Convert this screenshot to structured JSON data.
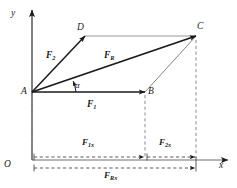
{
  "figure": {
    "background_color": "#ffffff",
    "stroke_color": "#1a1a1a",
    "dashed_color": "#8c8c8c",
    "thin_color": "#555555"
  },
  "axes": {
    "x_label": "x",
    "y_label": "y",
    "origin_label": "O"
  },
  "points": {
    "A": "A",
    "B": "B",
    "C": "C",
    "D": "D"
  },
  "vectors": {
    "f1": {
      "base": "F",
      "sub": "1"
    },
    "f2": {
      "base": "F",
      "sub": "2"
    },
    "fr": {
      "base": "F",
      "sub": "R"
    }
  },
  "dimensions": {
    "f1x": {
      "base": "F",
      "sub": "1x"
    },
    "f2x": {
      "base": "F",
      "sub": "2x"
    },
    "frx": {
      "base": "F",
      "sub": "Rx"
    }
  },
  "angle": {
    "label": "α"
  },
  "geometry": {
    "A": [
      32,
      92
    ],
    "B": [
      145,
      92
    ],
    "C": [
      196,
      36
    ],
    "D": [
      85,
      36
    ],
    "x_axis_y": 160,
    "y_axis_x": 32,
    "f1x_dim_y": 157,
    "f2x_dim_y": 157,
    "frx_dim_y": 168
  }
}
